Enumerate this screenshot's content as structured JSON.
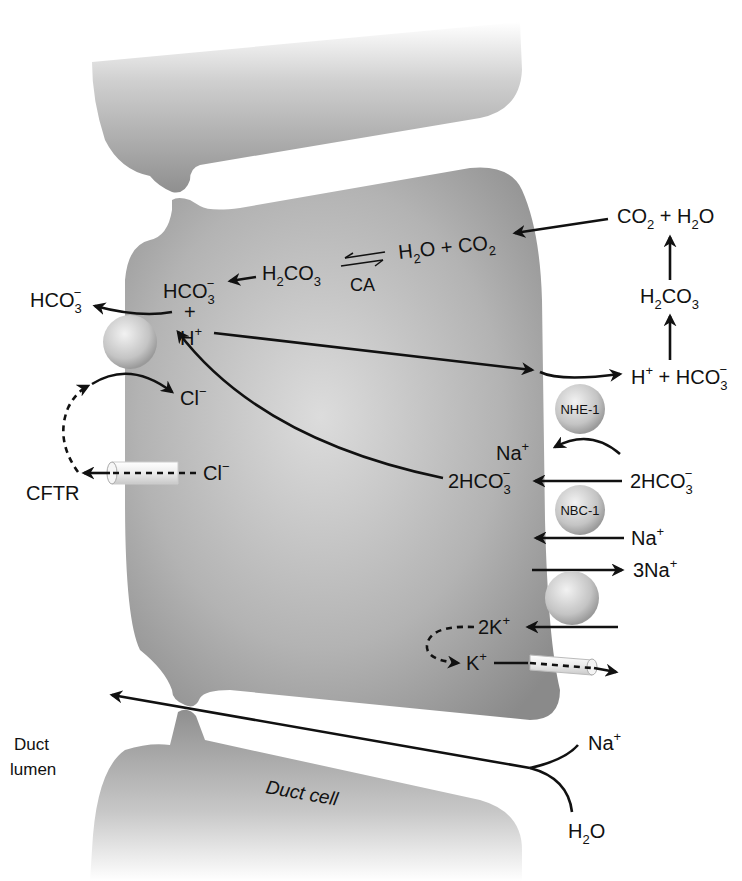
{
  "figure": {
    "cells": {
      "main_cell": "duct cell (center)",
      "lower_cell_label": "Duct cell"
    },
    "lumen_label_line1": "Duct",
    "lumen_label_line2": "lumen",
    "intracellular": {
      "hco3": {
        "base": "HCO",
        "sub": "3",
        "sup": "−"
      },
      "h2co3": {
        "base1": "H",
        "sub1": "2",
        "base2": "CO",
        "sub2": "3"
      },
      "h2o_co2": {
        "h": "H",
        "sub": "2",
        "o_plus": "O + CO",
        "sub2": "2"
      },
      "ca_label": "CA",
      "plus_sign": "+",
      "h_plus": {
        "base": "H",
        "sup": "+"
      },
      "cl_minus": {
        "base": "Cl",
        "sup": "−"
      },
      "na_plus_nhe": {
        "base": "Na",
        "sup": "+"
      },
      "two_hco3": {
        "base": "2HCO",
        "sub": "3",
        "sup": "−"
      },
      "two_k": {
        "base": "2K",
        "sup": "+"
      },
      "k_plus": {
        "base": "K",
        "sup": "+"
      }
    },
    "luminal": {
      "hco3_out": {
        "base": "HCO",
        "sub": "3",
        "sup": "−"
      },
      "cftr_label": "CFTR",
      "cl_minus_cftr": {
        "base": "Cl",
        "sup": "−"
      }
    },
    "basolateral": {
      "co2_h2o": {
        "a": "CO",
        "sub1": "2",
        "b": " + H",
        "sub2": "2",
        "c": "O"
      },
      "h2co3": {
        "base1": "H",
        "sub1": "2",
        "base2": "CO",
        "sub2": "3"
      },
      "h_hco3": {
        "h": "H",
        "sup1": "+",
        "plus": " + HCO",
        "sub": "3",
        "sup2": "−"
      },
      "two_hco3": {
        "base": "2HCO",
        "sub": "3",
        "sup": "−"
      },
      "na_plus": {
        "base": "Na",
        "sup": "+"
      },
      "three_na": {
        "base": "3Na",
        "sup": "+"
      }
    },
    "transporters": {
      "nhe1": "NHE-1",
      "nbc1": "NBC-1"
    },
    "paracellular": {
      "na_plus": {
        "base": "Na",
        "sup": "+"
      },
      "h2o": {
        "h": "H",
        "sub": "2",
        "o": "O"
      }
    },
    "colors": {
      "cell_fill": "#9a9a9a",
      "cell_highlight": "#d8d8d8",
      "arrow": "#111111",
      "background": "#ffffff"
    }
  }
}
